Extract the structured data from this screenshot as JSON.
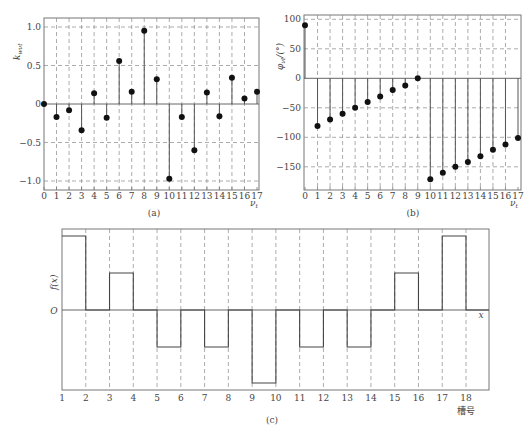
{
  "chart_data": [
    {
      "id": "a",
      "type": "scatter",
      "subtype": "stem",
      "caption": "(a)",
      "xlabel": "ν_t",
      "ylabel": "k_wνt",
      "x": [
        0,
        1,
        2,
        3,
        4,
        5,
        6,
        7,
        8,
        9,
        10,
        11,
        12,
        13,
        14,
        15,
        16,
        17
      ],
      "values": [
        0,
        -0.17,
        -0.08,
        -0.34,
        0.14,
        -0.18,
        0.56,
        0.16,
        0.95,
        0.32,
        -0.97,
        -0.17,
        -0.6,
        0.15,
        -0.16,
        0.34,
        0.07,
        0.16
      ],
      "yticks": [
        1.0,
        0.5,
        0,
        -0.5,
        -1.0
      ],
      "ytick_labels": [
        "1.0",
        "0.5",
        "0",
        "−0.5",
        "−1.0"
      ],
      "ylim": [
        -1.1,
        1.1
      ],
      "xlim": [
        0,
        17
      ],
      "grid": true
    },
    {
      "id": "b",
      "type": "scatter",
      "subtype": "stem",
      "caption": "(b)",
      "xlabel": "ν_t",
      "ylabel": "φ_νt/(°)",
      "x": [
        0,
        1,
        2,
        3,
        4,
        5,
        6,
        7,
        8,
        9,
        10,
        11,
        12,
        13,
        14,
        15,
        16,
        17
      ],
      "values": [
        90,
        -81,
        -70,
        -60,
        -50,
        -40,
        -31,
        -20,
        -12,
        0,
        -171,
        -160,
        -150,
        -142,
        -132,
        -121,
        -112,
        -101
      ],
      "yticks": [
        100,
        50,
        0,
        -50,
        -100,
        -150
      ],
      "ytick_labels": [
        "100",
        "50",
        "0",
        "−50",
        "−100",
        "−150"
      ],
      "ylim": [
        -185,
        108
      ],
      "xlim": [
        0,
        17
      ],
      "grid": true
    },
    {
      "id": "c",
      "type": "line",
      "subtype": "step",
      "caption": "(c)",
      "xlabel": "槽号",
      "ylabel": "f(x)",
      "origin_label": "O",
      "x_axis_label": "x",
      "x_ticks": [
        1,
        2,
        3,
        4,
        5,
        6,
        7,
        8,
        9,
        10,
        11,
        12,
        13,
        14,
        15,
        16,
        17,
        18
      ],
      "segments": [
        {
          "from": 1,
          "to": 2,
          "level": 2
        },
        {
          "from": 2,
          "to": 3,
          "level": 0
        },
        {
          "from": 3,
          "to": 4,
          "level": 1
        },
        {
          "from": 4,
          "to": 5,
          "level": 0
        },
        {
          "from": 5,
          "to": 6,
          "level": -1
        },
        {
          "from": 6,
          "to": 7,
          "level": 0
        },
        {
          "from": 7,
          "to": 8,
          "level": -1
        },
        {
          "from": 8,
          "to": 9,
          "level": 0
        },
        {
          "from": 9,
          "to": 10,
          "level": -2
        },
        {
          "from": 10,
          "to": 11,
          "level": 0
        },
        {
          "from": 11,
          "to": 12,
          "level": -1
        },
        {
          "from": 12,
          "to": 13,
          "level": 0
        },
        {
          "from": 13,
          "to": 14,
          "level": -1
        },
        {
          "from": 14,
          "to": 15,
          "level": 0
        },
        {
          "from": 15,
          "to": 16,
          "level": 1
        },
        {
          "from": 16,
          "to": 17,
          "level": 0
        },
        {
          "from": 17,
          "to": 18,
          "level": 2
        },
        {
          "from": 18,
          "to": 19,
          "level": 0
        }
      ],
      "grid": true
    }
  ],
  "captions": {
    "a": "(a)",
    "b": "(b)",
    "c": "(c)"
  }
}
